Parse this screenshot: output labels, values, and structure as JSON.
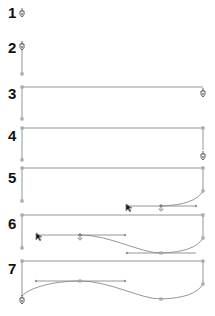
{
  "diagram": {
    "colors": {
      "path": "#8a8a8a",
      "label": "#111111",
      "anchor_fill": "#ffffff",
      "anchor_stroke": "#777777"
    },
    "steps": [
      {
        "label": "1",
        "y": 5
      },
      {
        "label": "2",
        "y": 40
      },
      {
        "label": "3",
        "y": 86
      },
      {
        "label": "4",
        "y": 128
      },
      {
        "label": "5",
        "y": 170
      },
      {
        "label": "6",
        "y": 216
      },
      {
        "label": "7",
        "y": 261
      }
    ],
    "icons": {
      "pen": "pen-tool-icon",
      "arrow": "direct-selection-arrow-icon"
    }
  }
}
